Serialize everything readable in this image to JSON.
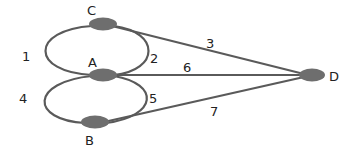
{
  "diagram": {
    "type": "multigraph",
    "colors": {
      "edge": "#5a5a5a",
      "node": "#6e6e6e",
      "text": "#222222",
      "background": "#ffffff"
    },
    "nodes": [
      {
        "id": "C",
        "label": "C",
        "x": 103,
        "y": 24
      },
      {
        "id": "A",
        "label": "A",
        "x": 103,
        "y": 75
      },
      {
        "id": "B",
        "label": "B",
        "x": 95,
        "y": 122
      },
      {
        "id": "D",
        "label": "D",
        "x": 312,
        "y": 75
      }
    ],
    "edges": [
      {
        "id": "1",
        "label": "1",
        "from": "C",
        "to": "A",
        "side": "left"
      },
      {
        "id": "2",
        "label": "2",
        "from": "C",
        "to": "A",
        "side": "right"
      },
      {
        "id": "3",
        "label": "3",
        "from": "C",
        "to": "D"
      },
      {
        "id": "4",
        "label": "4",
        "from": "A",
        "to": "B",
        "side": "left"
      },
      {
        "id": "5",
        "label": "5",
        "from": "A",
        "to": "B",
        "side": "right"
      },
      {
        "id": "6",
        "label": "6",
        "from": "A",
        "to": "D"
      },
      {
        "id": "7",
        "label": "7",
        "from": "B",
        "to": "D"
      }
    ]
  }
}
